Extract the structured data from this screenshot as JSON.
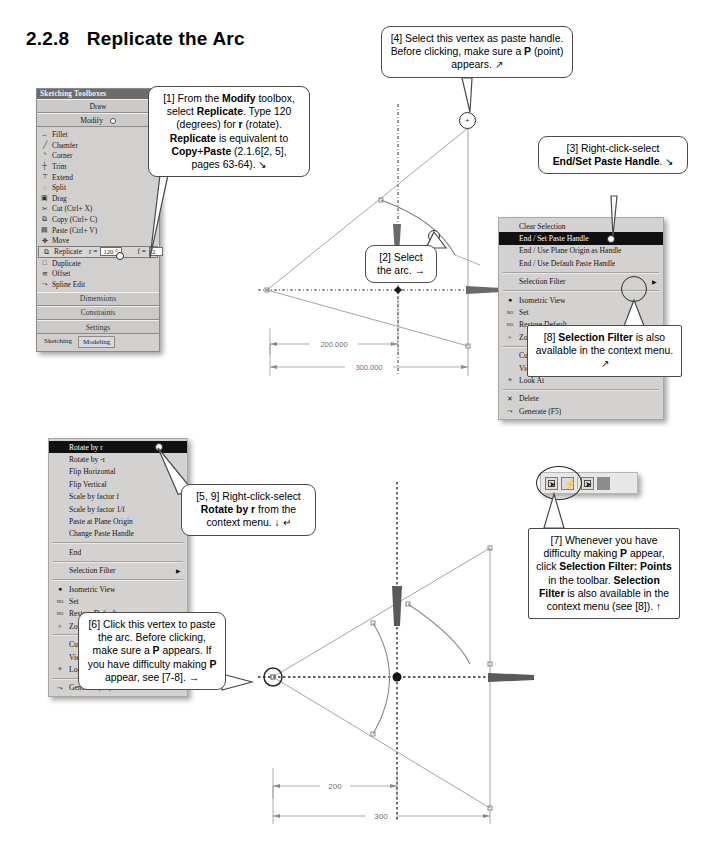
{
  "heading": {
    "number": "2.2.8",
    "title": "Replicate the Arc"
  },
  "toolbox": {
    "window_title": "Sketching Toolboxes",
    "sections": {
      "draw": "Draw",
      "modify": "Modify"
    },
    "items": [
      {
        "label": "Fillet",
        "glyph": "⌢"
      },
      {
        "label": "Chamfer",
        "glyph": "╱"
      },
      {
        "label": "Corner",
        "glyph": "⌝"
      },
      {
        "label": "Trim",
        "glyph": "┼"
      },
      {
        "label": "Extend",
        "glyph": "⊤"
      },
      {
        "label": "Split",
        "glyph": "◌"
      },
      {
        "label": "Drag",
        "glyph": "▣"
      },
      {
        "label": "Cut (Ctrl+ X)",
        "glyph": "✂"
      },
      {
        "label": "Copy (Ctrl+ C)",
        "glyph": "⧉"
      },
      {
        "label": "Paste (Ctrl+ V)",
        "glyph": "▤"
      },
      {
        "label": "Move",
        "glyph": "✥"
      }
    ],
    "replicate": {
      "label": "Replicate",
      "glyph": "⧉",
      "r_label": "r =",
      "r_value": "120 °",
      "f_label": "f =",
      "f_value": "2"
    },
    "items_after": [
      {
        "label": "Duplicate",
        "glyph": "□"
      },
      {
        "label": "Offset",
        "glyph": "≋"
      },
      {
        "label": "Spline Edit",
        "glyph": "⤳"
      }
    ],
    "bands": [
      "Dimensions",
      "Constraints",
      "Settings"
    ],
    "tabs": [
      {
        "label": "Sketching",
        "active": false
      },
      {
        "label": "Modeling",
        "active": true
      }
    ]
  },
  "callouts": {
    "c1": {
      "id": "[1]",
      "html": "[1] From the <b>Modify</b> toolbox, select <b>Replicate</b>. Type 120 (degrees) for <b>r</b> (rotate). <b>Replicate</b> is equivalent to <b>Copy</b>+<b>Paste</b> (2.1.6[2, 5], pages 63-64). ↘"
    },
    "c2": {
      "id": "[2]",
      "html": "[2] Select the arc. →"
    },
    "c3": {
      "id": "[3]",
      "html": "[3] Right-click-select <b>End/Set Paste Handle</b>. ↘"
    },
    "c4": {
      "id": "[4]",
      "html": "[4] Select this vertex as paste handle. Before clicking, make sure a <b>P</b> (point) appears. ↗"
    },
    "c5": {
      "id": "[5, 9]",
      "html": "[5, 9] Right-click-select <b>Rotate by r</b> from the context menu. ↓ ↵"
    },
    "c6": {
      "id": "[6]",
      "html": "[6] Click this vertex to paste the arc. Before clicking, make sure a <b>P</b> appears. If you have difficulty making <b>P</b> appear, see [7-8]. →"
    },
    "c7": {
      "id": "[7]",
      "html": "[7] Whenever you have difficulty making <b>P</b> appear, click <b>Selection Filter: Points</b> in the toolbar. <b>Selection Filter</b> is also available in the context menu (see [8]). ↑"
    },
    "c8": {
      "id": "[8]",
      "html": "[8] <b>Selection Filter</b> is also available in the context menu. ↗"
    }
  },
  "context_menu_top": {
    "items": [
      {
        "label": "Clear Selection",
        "icon": "",
        "highlight": false,
        "submenu": false
      },
      {
        "label": "End / Set Paste Handle",
        "icon": "",
        "highlight": true,
        "submenu": false
      },
      {
        "label": "End / Use Plane Origin as Handle",
        "icon": "",
        "highlight": false,
        "submenu": false
      },
      {
        "label": "End / Use Default Paste Handle",
        "icon": "",
        "highlight": false,
        "submenu": false
      },
      {
        "sep": true
      },
      {
        "label": "Selection Filter",
        "icon": "",
        "highlight": false,
        "submenu": true
      },
      {
        "sep": true
      },
      {
        "label": "Isometric View",
        "icon": "●",
        "highlight": false,
        "submenu": false
      },
      {
        "label": "Set",
        "icon": "ISO",
        "highlight": false,
        "submenu": false
      },
      {
        "label": "Restore Default",
        "icon": "ISO",
        "highlight": false,
        "submenu": false
      },
      {
        "label": "Zoom to Fit",
        "icon": "⌕",
        "highlight": false,
        "submenu": false
      },
      {
        "sep": true
      },
      {
        "label": "Cursor Mode",
        "icon": "",
        "highlight": false,
        "submenu": true
      },
      {
        "label": "View",
        "icon": "",
        "highlight": false,
        "submenu": true
      },
      {
        "label": "Look At",
        "icon": "⌖",
        "highlight": false,
        "submenu": false
      },
      {
        "sep": true
      },
      {
        "label": "Delete",
        "icon": "✕",
        "highlight": false,
        "submenu": false
      },
      {
        "label": "Generate (F5)",
        "icon": "⤳",
        "highlight": false,
        "submenu": false
      }
    ]
  },
  "context_menu_bottom": {
    "items": [
      {
        "label": "Rotate by r",
        "icon": "",
        "highlight": true,
        "submenu": false
      },
      {
        "label": "Rotate by -r",
        "icon": "",
        "highlight": false,
        "submenu": false
      },
      {
        "label": "Flip Horizontal",
        "icon": "",
        "highlight": false,
        "submenu": false
      },
      {
        "label": "Flip Vertical",
        "icon": "",
        "highlight": false,
        "submenu": false
      },
      {
        "label": "Scale by factor f",
        "icon": "",
        "highlight": false,
        "submenu": false
      },
      {
        "label": "Scale by factor 1/f",
        "icon": "",
        "highlight": false,
        "submenu": false
      },
      {
        "label": "Paste at Plane Origin",
        "icon": "",
        "highlight": false,
        "submenu": false
      },
      {
        "label": "Change Paste Handle",
        "icon": "",
        "highlight": false,
        "submenu": false
      },
      {
        "sep": true
      },
      {
        "label": "End",
        "icon": "",
        "highlight": false,
        "submenu": false
      },
      {
        "sep": true
      },
      {
        "label": "Selection Filter",
        "icon": "",
        "highlight": false,
        "submenu": true
      },
      {
        "sep": true
      },
      {
        "label": "Isometric View",
        "icon": "●",
        "highlight": false,
        "submenu": false
      },
      {
        "label": "Set",
        "icon": "ISO",
        "highlight": false,
        "submenu": false
      },
      {
        "label": "Restore Default",
        "icon": "ISO",
        "highlight": false,
        "submenu": false
      },
      {
        "label": "Zoom to Fit",
        "icon": "⌕",
        "highlight": false,
        "submenu": false
      },
      {
        "sep": true
      },
      {
        "label": "Cursor Mode",
        "icon": "",
        "highlight": false,
        "submenu": true
      },
      {
        "label": "View",
        "icon": "",
        "highlight": false,
        "submenu": true
      },
      {
        "label": "Look At",
        "icon": "⌖",
        "highlight": false,
        "submenu": false
      },
      {
        "sep": true
      },
      {
        "label": "Generate (F5)",
        "icon": "⤳",
        "highlight": false,
        "submenu": false
      }
    ]
  },
  "selection_filter_toolbar": {
    "buttons": [
      {
        "name": "select-points",
        "style": "cursor"
      },
      {
        "name": "select-edges",
        "style": "bolt"
      },
      {
        "name": "select-faces",
        "style": "cursor"
      },
      {
        "name": "select-bodies",
        "style": "solid"
      }
    ]
  },
  "drawing_top": {
    "dimensions": [
      {
        "label": "200.000"
      },
      {
        "label": "300.000"
      }
    ]
  },
  "drawing_bottom": {
    "dimensions": [
      {
        "label": "200"
      },
      {
        "label": "300"
      }
    ]
  }
}
